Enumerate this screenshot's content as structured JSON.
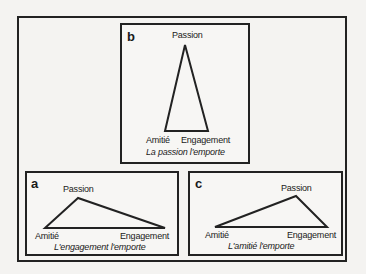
{
  "diagram": {
    "panels": [
      {
        "id": "b",
        "letter": "b",
        "vertices": {
          "passion": "Passion",
          "amitie": "Amitié",
          "engagement": "Engagement"
        },
        "caption": "La passion l'emporte"
      },
      {
        "id": "a",
        "letter": "a",
        "vertices": {
          "passion": "Passion",
          "amitie": "Amitié",
          "engagement": "Engagement"
        },
        "caption": "L'engagement l'emporte"
      },
      {
        "id": "c",
        "letter": "c",
        "vertices": {
          "passion": "Passion",
          "amitie": "Amitié",
          "engagement": "Engagement"
        },
        "caption": "L'amitié l'emporte"
      }
    ],
    "colors": {
      "line": "#222222",
      "background": "#f4f3f1"
    }
  }
}
